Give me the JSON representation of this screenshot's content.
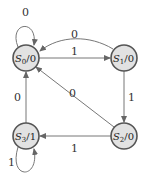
{
  "diagram": {
    "type": "finite-state-machine",
    "states": [
      {
        "id": "S0",
        "name": "S",
        "sub": "0",
        "output": "/0"
      },
      {
        "id": "S1",
        "name": "S",
        "sub": "1",
        "output": "/0"
      },
      {
        "id": "S2",
        "name": "S",
        "sub": "2",
        "output": "/0"
      },
      {
        "id": "S3",
        "name": "S",
        "sub": "3",
        "output": "/1"
      }
    ],
    "transitions": [
      {
        "from": "S0",
        "to": "S0",
        "label": "0"
      },
      {
        "from": "S0",
        "to": "S1",
        "label": "1"
      },
      {
        "from": "S1",
        "to": "S0",
        "label": "0"
      },
      {
        "from": "S1",
        "to": "S2",
        "label": "1"
      },
      {
        "from": "S2",
        "to": "S0",
        "label": "0"
      },
      {
        "from": "S2",
        "to": "S3",
        "label": "1"
      },
      {
        "from": "S3",
        "to": "S0",
        "label": "0"
      },
      {
        "from": "S3",
        "to": "S3",
        "label": "1"
      }
    ]
  }
}
